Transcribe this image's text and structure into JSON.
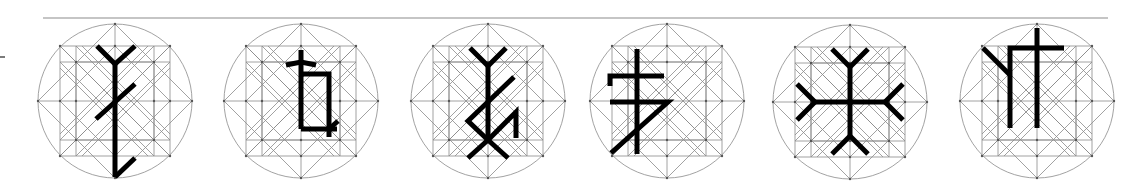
{
  "figure": {
    "top_rule": {
      "x1": 43,
      "x2": 1108,
      "y": 18
    },
    "side_mark": {
      "x1": 0,
      "x2": 5,
      "y": 57
    },
    "colors": {
      "grid": "#8a8a8a",
      "rune": "#000000",
      "background": "#ffffff"
    },
    "grid": {
      "radius": 77,
      "outer_square_half": 55,
      "inner_square_half": 39,
      "inner_diamond_radius": 55
    },
    "glyphs": [
      {
        "name": "glyph-1",
        "cx": 115,
        "cy": 101,
        "strokes": [
          [
            [
              97,
              46
            ],
            [
              115,
              64
            ],
            [
              135,
              46
            ]
          ],
          [
            [
              115,
              64
            ],
            [
              115,
              177
            ]
          ],
          [
            [
              135,
              84
            ],
            [
              96,
              119
            ]
          ],
          [
            [
              115,
              177
            ],
            [
              135,
              158
            ]
          ]
        ]
      },
      {
        "name": "glyph-2",
        "cx": 301,
        "cy": 101,
        "strokes": [
          [
            [
              301,
              50
            ],
            [
              301,
              129
            ]
          ],
          [
            [
              286,
              65
            ],
            [
              301,
              62
            ],
            [
              316,
              65
            ]
          ],
          [
            [
              301,
              74
            ],
            [
              329,
              74
            ],
            [
              329,
              137
            ]
          ],
          [
            [
              301,
              129
            ],
            [
              337,
              129
            ]
          ],
          [
            [
              329,
              129
            ],
            [
              338,
              121
            ]
          ]
        ]
      },
      {
        "name": "glyph-3",
        "cx": 488,
        "cy": 101,
        "strokes": [
          [
            [
              470,
              48
            ],
            [
              488,
              66
            ],
            [
              506,
              48
            ]
          ],
          [
            [
              488,
              66
            ],
            [
              488,
              140
            ]
          ],
          [
            [
              514,
              77
            ],
            [
              468,
              121
            ],
            [
              488,
              140
            ]
          ],
          [
            [
              468,
              158
            ],
            [
              488,
              140
            ],
            [
              508,
              158
            ]
          ],
          [
            [
              488,
              140
            ],
            [
              516,
              112
            ],
            [
              516,
              138
            ]
          ]
        ]
      },
      {
        "name": "glyph-4",
        "cx": 667,
        "cy": 101,
        "strokes": [
          [
            [
              637,
              49
            ],
            [
              637,
              154
            ]
          ],
          [
            [
              610,
              86
            ],
            [
              610,
              76
            ],
            [
              664,
              76
            ]
          ],
          [
            [
              610,
              102
            ],
            [
              668,
              102
            ],
            [
              611,
              153
            ]
          ]
        ]
      },
      {
        "name": "glyph-5",
        "cx": 850,
        "cy": 102,
        "strokes": [
          [
            [
              832,
              49
            ],
            [
              850,
              67
            ],
            [
              868,
              49
            ]
          ],
          [
            [
              850,
              67
            ],
            [
              850,
              136
            ]
          ],
          [
            [
              832,
              154
            ],
            [
              850,
              136
            ],
            [
              868,
              154
            ]
          ],
          [
            [
              797,
              84
            ],
            [
              815,
              102
            ],
            [
              797,
              120
            ]
          ],
          [
            [
              815,
              102
            ],
            [
              885,
              102
            ]
          ],
          [
            [
              903,
              84
            ],
            [
              885,
              102
            ],
            [
              903,
              120
            ]
          ]
        ]
      },
      {
        "name": "glyph-6",
        "cx": 1037,
        "cy": 101,
        "strokes": [
          [
            [
              983,
              48
            ],
            [
              1010,
              75
            ]
          ],
          [
            [
              1010,
              128
            ],
            [
              1010,
              48
            ],
            [
              1064,
              48
            ]
          ],
          [
            [
              1037,
              28
            ],
            [
              1037,
              128
            ]
          ]
        ]
      }
    ]
  }
}
